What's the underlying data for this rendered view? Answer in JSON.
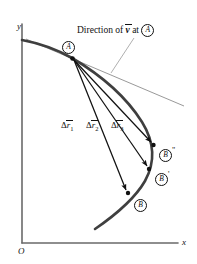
{
  "figure": {
    "type": "physics-trajectory-diagram",
    "background_color": "#ffffff",
    "ink_color": "#111111",
    "curve_color": "#3a3a3a",
    "width": 197,
    "height": 264
  },
  "axes": {
    "x_label": "x",
    "y_label": "y",
    "origin_label": "O",
    "x_axis": {
      "x1": 22,
      "y1": 243,
      "x2": 180,
      "y2": 243
    },
    "y_axis": {
      "x1": 22,
      "y1": 243,
      "x2": 22,
      "y2": 22
    }
  },
  "caption": {
    "prefix": "Direction of ",
    "vector_symbol": "v",
    "middle": " at ",
    "point_label": "A",
    "full_text": "Direction of v at A",
    "x": 77,
    "y": 27
  },
  "points": [
    {
      "name": "A",
      "label": "A",
      "prime": "",
      "dot_x": 72,
      "dot_y": 58,
      "label_x": 62,
      "label_y": 39
    },
    {
      "name": "B",
      "label": "B",
      "prime": "",
      "dot_x": 129,
      "dot_y": 194,
      "label_x": 134,
      "label_y": 198
    },
    {
      "name": "Bp",
      "label": "B",
      "prime": "'",
      "dot_x": 150,
      "dot_y": 170,
      "label_x": 155,
      "label_y": 172
    },
    {
      "name": "Bpp",
      "label": "B",
      "prime": "\"",
      "dot_x": 154,
      "dot_y": 146,
      "label_x": 159,
      "label_y": 148
    }
  ],
  "vectors": [
    {
      "name": "dr1",
      "label_base": "r",
      "label_delta": "Δ",
      "subscript": "1",
      "label_x": 62,
      "label_y": 123,
      "x1": 73,
      "y1": 60,
      "x2": 126,
      "y2": 190
    },
    {
      "name": "dr2",
      "label_base": "r",
      "label_delta": "Δ",
      "subscript": "2",
      "label_x": 86,
      "label_y": 123,
      "x1": 73,
      "y1": 60,
      "x2": 147,
      "y2": 167
    },
    {
      "name": "dr3",
      "label_base": "r",
      "label_delta": "Δ",
      "subscript": "3",
      "label_x": 110,
      "label_y": 123,
      "x1": 73,
      "y1": 60,
      "x2": 151,
      "y2": 143
    }
  ],
  "tangent_line": {
    "name": "velocity-direction-tangent",
    "x1": 26,
    "y1": 39,
    "x2": 184,
    "y2": 106
  },
  "leader_line": {
    "name": "caption-leader",
    "x1": 134,
    "y1": 38,
    "x2": 111,
    "y2": 73
  },
  "trajectory": {
    "name": "particle-path",
    "path": "M 22,40 C 38,43 58,50 72,58 C 99,74 125,95 142,122 C 155,143 155,162 145,180 C 134,199 114,216 95,229"
  }
}
